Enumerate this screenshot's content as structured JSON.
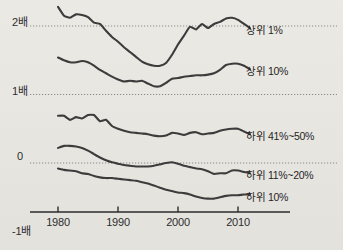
{
  "chart_data": {
    "type": "line",
    "title": "",
    "xlabel": "",
    "ylabel": "",
    "grid": true,
    "legend_position": "right-inline",
    "xlim": [
      1979,
      2012
    ],
    "ylim": [
      -1.35,
      2.45
    ],
    "x_ticks": [
      "1980",
      "1990",
      "2000",
      "2010"
    ],
    "x_tick_values": [
      1980,
      1990,
      2000,
      2010
    ],
    "y_ticks": [
      "2배",
      "1배",
      "0",
      "-1배"
    ],
    "y_tick_values": [
      2,
      1,
      0,
      -1
    ],
    "gridline_values": [
      2,
      1,
      0
    ],
    "line_color": "#3b3b3b",
    "grid_color": "#8a8a8a",
    "axis_color": "#2b2b2b",
    "series": [
      {
        "name": "상위 1%",
        "label": "상위 1%",
        "x": [
          1980,
          1981,
          1982,
          1983,
          1984,
          1985,
          1986,
          1987,
          1988,
          1989,
          1990,
          1991,
          1992,
          1993,
          1994,
          1995,
          1996,
          1997,
          1998,
          1999,
          2000,
          2001,
          2002,
          2003,
          2004,
          2005,
          2006,
          2007,
          2008,
          2009,
          2010,
          2011,
          2012
        ],
        "values": [
          2.28,
          2.15,
          2.12,
          2.17,
          2.16,
          2.13,
          2.05,
          2.03,
          1.93,
          1.84,
          1.77,
          1.69,
          1.62,
          1.55,
          1.48,
          1.44,
          1.42,
          1.42,
          1.46,
          1.58,
          1.73,
          1.86,
          1.99,
          1.95,
          2.03,
          1.97,
          2.03,
          2.06,
          2.11,
          2.12,
          2.09,
          2.03,
          1.97
        ]
      },
      {
        "name": "상위 10%",
        "label": "상위 10%",
        "x": [
          1980,
          1981,
          1982,
          1983,
          1984,
          1985,
          1986,
          1987,
          1988,
          1989,
          1990,
          1991,
          1992,
          1993,
          1994,
          1995,
          1996,
          1997,
          1998,
          1999,
          2000,
          2001,
          2002,
          2003,
          2004,
          2005,
          2006,
          2007,
          2008,
          2009,
          2010,
          2011,
          2012
        ],
        "values": [
          1.54,
          1.5,
          1.47,
          1.47,
          1.49,
          1.47,
          1.42,
          1.36,
          1.31,
          1.26,
          1.22,
          1.19,
          1.2,
          1.19,
          1.2,
          1.16,
          1.12,
          1.12,
          1.17,
          1.23,
          1.24,
          1.26,
          1.27,
          1.28,
          1.28,
          1.29,
          1.31,
          1.36,
          1.43,
          1.45,
          1.45,
          1.42,
          1.37
        ]
      },
      {
        "name": "하위 41%~50%",
        "label": "하위 41%~50%",
        "x": [
          1980,
          1981,
          1982,
          1983,
          1984,
          1985,
          1986,
          1987,
          1988,
          1989,
          1990,
          1991,
          1992,
          1993,
          1994,
          1995,
          1996,
          1997,
          1998,
          1999,
          2000,
          2001,
          2002,
          2003,
          2004,
          2005,
          2006,
          2007,
          2008,
          2009,
          2010,
          2011,
          2012
        ],
        "values": [
          0.69,
          0.69,
          0.63,
          0.67,
          0.65,
          0.7,
          0.7,
          0.61,
          0.63,
          0.54,
          0.5,
          0.47,
          0.45,
          0.44,
          0.43,
          0.42,
          0.4,
          0.39,
          0.4,
          0.44,
          0.43,
          0.41,
          0.44,
          0.45,
          0.42,
          0.43,
          0.44,
          0.47,
          0.49,
          0.5,
          0.5,
          0.46,
          0.42
        ]
      },
      {
        "name": "하위 11%~20%",
        "label": "하위 11%~20%",
        "x": [
          1980,
          1981,
          1982,
          1983,
          1984,
          1985,
          1986,
          1987,
          1988,
          1989,
          1990,
          1991,
          1992,
          1993,
          1994,
          1995,
          1996,
          1997,
          1998,
          1999,
          2000,
          2001,
          2002,
          2003,
          2004,
          2005,
          2006,
          2007,
          2008,
          2009,
          2010,
          2011,
          2012
        ],
        "values": [
          0.22,
          0.25,
          0.25,
          0.24,
          0.22,
          0.18,
          0.13,
          0.08,
          0.04,
          0.01,
          -0.01,
          -0.03,
          -0.04,
          -0.05,
          -0.05,
          -0.05,
          -0.04,
          -0.02,
          0.0,
          0.01,
          -0.01,
          -0.04,
          -0.06,
          -0.08,
          -0.09,
          -0.12,
          -0.16,
          -0.15,
          -0.15,
          -0.11,
          -0.11,
          -0.13,
          -0.15
        ]
      },
      {
        "name": "하위 10%",
        "label": "하위 10%",
        "x": [
          1980,
          1981,
          1982,
          1983,
          1984,
          1985,
          1986,
          1987,
          1988,
          1989,
          1990,
          1991,
          1992,
          1993,
          1994,
          1995,
          1996,
          1997,
          1998,
          1999,
          2000,
          2001,
          2002,
          2003,
          2004,
          2005,
          2006,
          2007,
          2008,
          2009,
          2010,
          2011,
          2012
        ],
        "values": [
          -0.08,
          -0.1,
          -0.11,
          -0.12,
          -0.15,
          -0.16,
          -0.19,
          -0.21,
          -0.22,
          -0.22,
          -0.23,
          -0.24,
          -0.25,
          -0.26,
          -0.28,
          -0.3,
          -0.33,
          -0.36,
          -0.39,
          -0.41,
          -0.43,
          -0.44,
          -0.46,
          -0.49,
          -0.51,
          -0.52,
          -0.52,
          -0.5,
          -0.48,
          -0.47,
          -0.47,
          -0.46,
          -0.46
        ]
      }
    ]
  },
  "axis": {
    "y_labels": [
      {
        "text": "2배",
        "value": 2
      },
      {
        "text": "1배",
        "value": 1
      },
      {
        "text": "0",
        "value": 0
      },
      {
        "text": "-1배",
        "value": -1
      }
    ],
    "x_labels": [
      {
        "text": "1980",
        "value": 1980
      },
      {
        "text": "1990",
        "value": 1990
      },
      {
        "text": "2000",
        "value": 2000
      },
      {
        "text": "2010",
        "value": 2010
      }
    ]
  },
  "legend": {
    "items": [
      {
        "label": "상위 1%"
      },
      {
        "label": "상위 10%"
      },
      {
        "label": "하위 41%~50%"
      },
      {
        "label": "하위 11%~20%"
      },
      {
        "label": "하위 10%"
      }
    ]
  }
}
